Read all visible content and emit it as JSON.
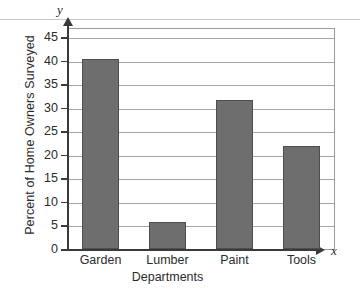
{
  "chart_data": {
    "type": "bar",
    "title": "",
    "categories": [
      "Garden",
      "Lumber",
      "Paint",
      "Tools"
    ],
    "values": [
      40.5,
      5.8,
      31.7,
      21.8
    ],
    "xlabel": "Departments",
    "ylabel": "Percent of Home Owners Surveyed",
    "ylim": [
      0,
      47
    ],
    "yticks": [
      0,
      5,
      10,
      15,
      20,
      25,
      30,
      35,
      40,
      45
    ],
    "ytick_labels": [
      "0",
      "5",
      "10",
      "15",
      "20",
      "25",
      "30",
      "35",
      "40",
      "45"
    ],
    "grid": "horizontal",
    "legend": "none",
    "axis_letters": {
      "x": "x",
      "y": "y"
    },
    "colors": {
      "bar_fill": "#6e6e6e",
      "bar_border": "#4e4e4e",
      "gridline": "#a6a6a6",
      "axis": "#3a3a3a",
      "text": "#2b2b2b",
      "background": "#ffffff"
    }
  }
}
